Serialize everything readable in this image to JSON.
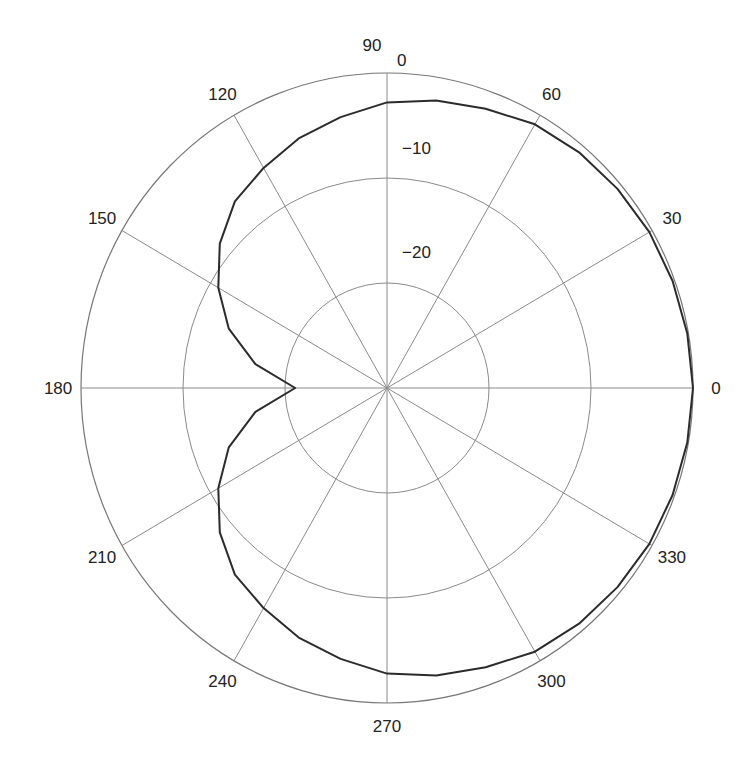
{
  "chart_data": {
    "type": "polar-line",
    "title": "",
    "angle_unit": "degrees",
    "angle_direction": "counterclockwise",
    "angle_zero": "right",
    "angle_tick_labels": [
      "0",
      "30",
      "60",
      "90",
      "120",
      "150",
      "180",
      "210",
      "240",
      "270",
      "300",
      "330"
    ],
    "angle_ticks": [
      0,
      30,
      60,
      90,
      120,
      150,
      180,
      210,
      240,
      270,
      300,
      330
    ],
    "top_annotation": "0",
    "radial_tick_labels": [
      "−10",
      "−20"
    ],
    "radial_ticks": [
      -10,
      -20
    ],
    "rlim": [
      -30,
      0
    ],
    "grid": true,
    "legend": null,
    "series": [
      {
        "name": "pattern",
        "angles": [
          0,
          10,
          20,
          30,
          40,
          50,
          60,
          70,
          80,
          90,
          100,
          110,
          120,
          130,
          140,
          150,
          160,
          170,
          180,
          190,
          200,
          210,
          220,
          230,
          240,
          250,
          260,
          270,
          280,
          290,
          300,
          310,
          320,
          330,
          340,
          350,
          360
        ],
        "values": [
          0,
          -0.1,
          -0.2,
          -0.3,
          -0.5,
          -0.7,
          -1.0,
          -1.7,
          -2.2,
          -2.8,
          -3.8,
          -4.7,
          -5.8,
          -6.8,
          -8.6,
          -10.9,
          -13.5,
          -16.9,
          -21,
          -16.9,
          -13.5,
          -10.9,
          -8.6,
          -6.8,
          -5.8,
          -4.7,
          -3.8,
          -2.8,
          -2.2,
          -1.7,
          -1.0,
          -0.7,
          -0.5,
          -0.3,
          -0.2,
          -0.1,
          0
        ]
      }
    ]
  },
  "labels": {
    "top_zero": "0",
    "ring_minus10": "−10",
    "ring_minus20": "−20"
  }
}
